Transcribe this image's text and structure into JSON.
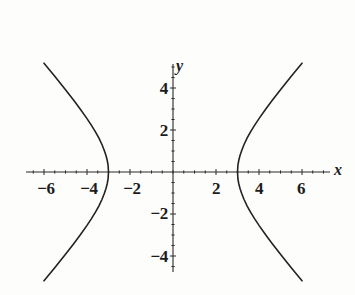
{
  "figure": {
    "background_color": "#fdfdfc",
    "curve_color": "#222222",
    "axis_color": "#2b2b2b"
  },
  "axes": {
    "x_axis_label": "x",
    "y_axis_label": "y",
    "x_ticks": [
      {
        "value": -6,
        "label": "−6",
        "px": 46
      },
      {
        "value": -4,
        "label": "−4",
        "px": 89
      },
      {
        "value": -2,
        "label": "−2",
        "px": 132
      },
      {
        "value": 2,
        "label": "2",
        "px": 216
      },
      {
        "value": 4,
        "label": "4",
        "px": 259
      },
      {
        "value": 6,
        "label": "6",
        "px": 301
      }
    ],
    "y_ticks": [
      {
        "value": 4,
        "label": "4",
        "px": 88
      },
      {
        "value": 2,
        "label": "2",
        "px": 130
      },
      {
        "value": -2,
        "label": "−2",
        "px": 213
      },
      {
        "value": -4,
        "label": "−4",
        "px": 256
      }
    ]
  },
  "chart_data": {
    "type": "line",
    "title": "",
    "xlabel": "x",
    "ylabel": "y",
    "grid": false,
    "legend": "none",
    "xlim": [
      -7.0,
      7.6
    ],
    "ylim": [
      -5.2,
      5.0
    ],
    "xticks": [
      -6,
      -4,
      -2,
      2,
      4,
      6
    ],
    "yticks": [
      -4,
      -2,
      2,
      4
    ],
    "equation": "x^2/9 - y^2/16 = 1",
    "vertices": [
      [
        -3,
        0
      ],
      [
        3,
        0
      ]
    ],
    "asymptote_slopes": [
      1.3333,
      -1.3333
    ],
    "series": [
      {
        "name": "right-branch",
        "points": [
          [
            3.0,
            0.0
          ],
          [
            3.02,
            0.33
          ],
          [
            3.06,
            0.56
          ],
          [
            3.12,
            0.8
          ],
          [
            3.2,
            1.04
          ],
          [
            3.3,
            1.3
          ],
          [
            3.45,
            1.62
          ],
          [
            3.6,
            1.9
          ],
          [
            3.8,
            2.23
          ],
          [
            4.0,
            2.54
          ],
          [
            4.3,
            2.98
          ],
          [
            4.6,
            3.39
          ],
          [
            5.0,
            3.92
          ],
          [
            5.5,
            4.56
          ],
          [
            6.0,
            5.18
          ],
          [
            6.5,
            5.8
          ],
          [
            7.0,
            6.41
          ],
          [
            7.5,
            7.02
          ]
        ]
      },
      {
        "name": "left-branch",
        "points": [
          [
            -3.0,
            0.0
          ],
          [
            -3.02,
            0.33
          ],
          [
            -3.06,
            0.56
          ],
          [
            -3.12,
            0.8
          ],
          [
            -3.2,
            1.04
          ],
          [
            -3.3,
            1.3
          ],
          [
            -3.45,
            1.62
          ],
          [
            -3.6,
            1.9
          ],
          [
            -3.8,
            2.23
          ],
          [
            -4.0,
            2.54
          ],
          [
            -4.3,
            2.98
          ],
          [
            -4.6,
            3.39
          ],
          [
            -5.0,
            3.92
          ],
          [
            -5.5,
            4.56
          ],
          [
            -6.0,
            5.18
          ],
          [
            -6.5,
            5.8
          ],
          [
            -7.0,
            6.41
          ]
        ]
      }
    ]
  }
}
